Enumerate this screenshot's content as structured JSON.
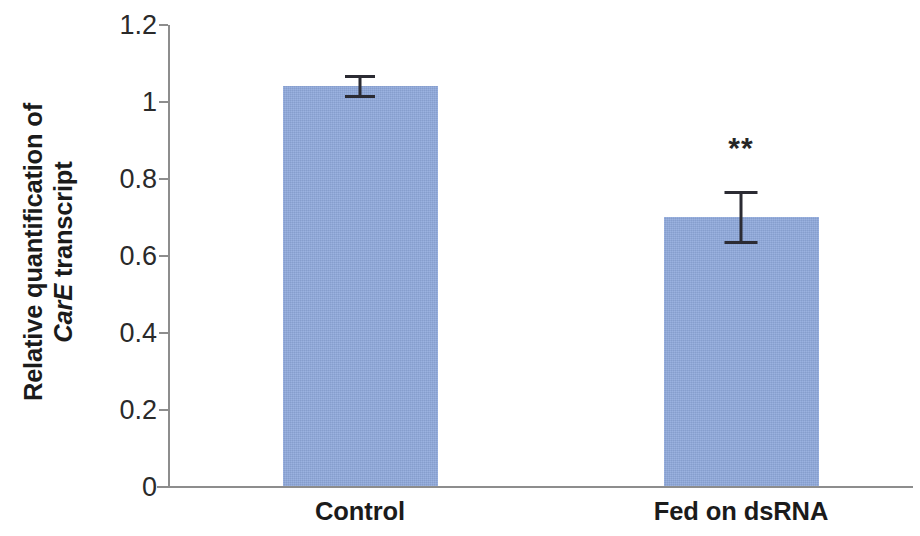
{
  "chart_data": {
    "type": "bar",
    "title": "",
    "xlabel": "",
    "ylabel_line1": "Relative quantification of",
    "ylabel_line2_italic": "CarE",
    "ylabel_line2_rest": " transcript",
    "categories": [
      "Control",
      "Fed on dsRNA"
    ],
    "values": [
      1.04,
      0.7
    ],
    "errors": [
      0.03,
      0.07
    ],
    "annotations": [
      {
        "category": "Fed on dsRNA",
        "text": "**"
      }
    ],
    "ylim": [
      0,
      1.2
    ],
    "ytick_values": [
      0,
      0.2,
      0.4,
      0.6,
      0.8,
      1,
      1.2
    ],
    "ytick_labels": [
      "0",
      "0.2",
      "0.4",
      "0.6",
      "0.8",
      "1",
      "1.2"
    ],
    "grid": false,
    "legend": "none",
    "bar_color": "#8fa9dc",
    "axis_color": "#8d8d8d",
    "error_color": "#2b2b33",
    "text_color": "#1b1b1b"
  }
}
